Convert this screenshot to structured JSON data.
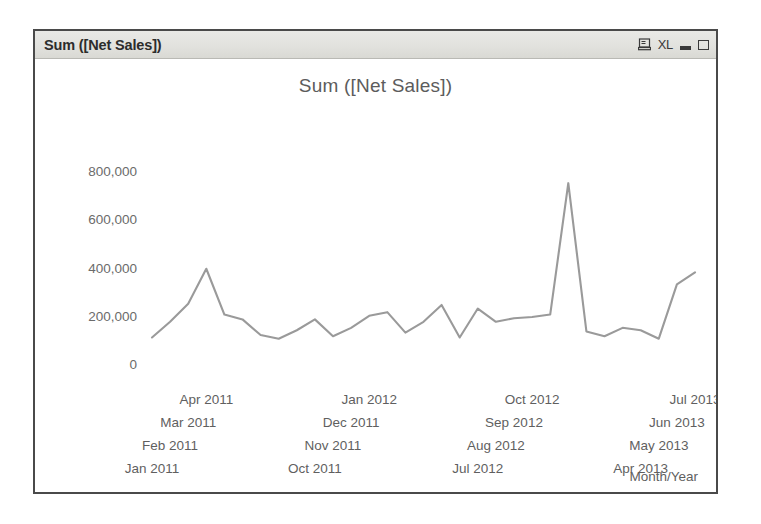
{
  "window": {
    "title": "Sum ([Net Sales])",
    "controls": {
      "export_icon": "monitor-export-icon",
      "excel_label": "XL",
      "minimize_label": "",
      "maximize_label": ""
    }
  },
  "chart_data": {
    "type": "line",
    "title": "Sum ([Net Sales])",
    "xlabel": "Month/Year",
    "ylabel": "",
    "ylim": [
      0,
      900000
    ],
    "yticks": [
      0,
      200000,
      400000,
      600000,
      800000
    ],
    "ytick_labels": [
      "0",
      "200,000",
      "400,000",
      "600,000",
      "800,000"
    ],
    "grid": false,
    "legend": null,
    "line_color": "#9a9a9a",
    "categories": [
      "Jan 2011",
      "Feb 2011",
      "Mar 2011",
      "Apr 2011",
      "May 2011",
      "Jun 2011",
      "Jul 2011",
      "Aug 2011",
      "Sep 2011",
      "Oct 2011",
      "Nov 2011",
      "Dec 2011",
      "Jan 2012",
      "Feb 2012",
      "Mar 2012",
      "Apr 2012",
      "May 2012",
      "Jun 2012",
      "Jul 2012",
      "Aug 2012",
      "Sep 2012",
      "Oct 2012",
      "Nov 2012",
      "Dec 2012",
      "Jan 2013",
      "Feb 2013",
      "Mar 2013",
      "Apr 2013",
      "May 2013",
      "Jun 2013",
      "Jul 2013"
    ],
    "values": [
      110000,
      175000,
      250000,
      395000,
      205000,
      185000,
      120000,
      105000,
      140000,
      185000,
      115000,
      150000,
      200000,
      215000,
      130000,
      175000,
      245000,
      110000,
      230000,
      175000,
      190000,
      195000,
      205000,
      750000,
      135000,
      115000,
      150000,
      140000,
      105000,
      330000,
      380000
    ],
    "visible_xtick_labels": [
      {
        "label": "Jan 2011",
        "row": 4,
        "index": 0
      },
      {
        "label": "Feb 2011",
        "row": 3,
        "index": 1
      },
      {
        "label": "Mar 2011",
        "row": 2,
        "index": 2
      },
      {
        "label": "Apr 2011",
        "row": 1,
        "index": 3
      },
      {
        "label": "Oct 2011",
        "row": 4,
        "index": 9
      },
      {
        "label": "Nov 2011",
        "row": 3,
        "index": 10
      },
      {
        "label": "Dec 2011",
        "row": 2,
        "index": 11
      },
      {
        "label": "Jan 2012",
        "row": 1,
        "index": 12
      },
      {
        "label": "Jul 2012",
        "row": 4,
        "index": 18
      },
      {
        "label": "Aug 2012",
        "row": 3,
        "index": 19
      },
      {
        "label": "Sep 2012",
        "row": 2,
        "index": 20
      },
      {
        "label": "Oct 2012",
        "row": 1,
        "index": 21
      },
      {
        "label": "Apr 2013",
        "row": 4,
        "index": 27
      },
      {
        "label": "May 2013",
        "row": 3,
        "index": 28
      },
      {
        "label": "Jun 2013",
        "row": 2,
        "index": 29
      },
      {
        "label": "Jul 2013",
        "row": 1,
        "index": 30
      }
    ]
  }
}
